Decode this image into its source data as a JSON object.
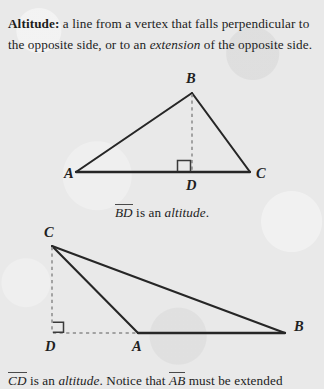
{
  "page": {
    "background_color": "#e9e9e9",
    "ink_color": "#1c1c1c",
    "guide_color": "#8a8a8a"
  },
  "definition": {
    "term": "Altitude:",
    "text_part_1": " a line from a vertex that falls perpendicular to the opposite side, or to an ",
    "emphasis": "extension",
    "text_part_2": " of the opposite side."
  },
  "figures": [
    {
      "id": "acute-triangle",
      "name": "triangle-with-interior-altitude",
      "vertices": {
        "A": {
          "label": "A",
          "x": 76,
          "y": 172,
          "label_x": 64,
          "label_y": 178
        },
        "B": {
          "label": "B",
          "x": 192,
          "y": 93,
          "label_x": 186,
          "label_y": 83
        },
        "C": {
          "label": "C",
          "x": 250,
          "y": 172,
          "label_x": 256,
          "label_y": 178
        },
        "D": {
          "label": "D",
          "x": 192,
          "y": 172,
          "label_x": 186,
          "label_y": 190
        }
      },
      "solid_sides": [
        "A-B",
        "B-C",
        "A-C"
      ],
      "dashed_segments": [
        "B-D"
      ],
      "right_angle_at": "D",
      "right_angle_opens": "up-left"
    },
    {
      "id": "obtuse-triangle",
      "name": "triangle-with-exterior-altitude",
      "vertices": {
        "C": {
          "label": "C",
          "x": 52,
          "y": 246,
          "label_x": 44,
          "label_y": 237
        },
        "D": {
          "label": "D",
          "x": 52,
          "y": 333,
          "label_x": 45,
          "label_y": 351
        },
        "A": {
          "label": "A",
          "x": 138,
          "y": 333,
          "label_x": 132,
          "label_y": 351
        },
        "B": {
          "label": "B",
          "x": 285,
          "y": 333,
          "label_x": 294,
          "label_y": 331
        }
      },
      "solid_sides": [
        "C-A",
        "C-B",
        "A-B"
      ],
      "dashed_segments": [
        "C-D",
        "D-A"
      ],
      "right_angle_at": "D",
      "right_angle_opens": "up-right"
    }
  ],
  "captions": {
    "acute": {
      "segment": "BD",
      "text_middle": " is an ",
      "emphasis": "altitude",
      "text_end": "."
    },
    "obtuse": {
      "segment_1": "CD",
      "text_1": " is an ",
      "emphasis": "altitude",
      "text_2": ". Notice that ",
      "segment_2": "AB",
      "text_3": " must be extended"
    }
  }
}
